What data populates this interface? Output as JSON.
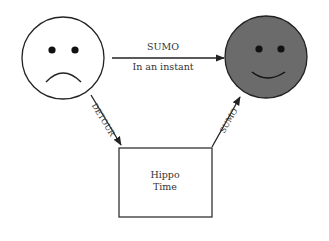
{
  "diagram": {
    "nodes": {
      "sad_face": {
        "label": "",
        "fill": "#ffffff",
        "stroke": "#222222"
      },
      "happy_face": {
        "label": "",
        "fill": "#6b6b6b",
        "stroke": "#222222"
      },
      "box": {
        "line1": "Hippo",
        "line2": "Time",
        "fill": "#ffffff",
        "stroke": "#333333"
      }
    },
    "edges": {
      "top": {
        "label_above": "SUMO",
        "label_below": "In an instant"
      },
      "left": {
        "label": "DETOUR"
      },
      "right": {
        "label": "SUMO"
      }
    }
  }
}
